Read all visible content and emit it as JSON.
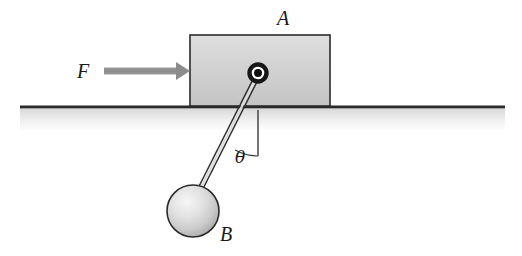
{
  "figure": {
    "background_color": "#ffffff",
    "width": 522,
    "height": 256
  },
  "labels": {
    "block_label": "A",
    "force_label": "F",
    "ball_label": "B",
    "angle_label": "θ"
  },
  "colors": {
    "outline": "#1a1a1a",
    "block_fill_top": "#d6d6d6",
    "block_fill_bottom": "#c2c2c2",
    "ground_dark_line": "#2b2b2b",
    "ground_band_top": "#d8d8d8",
    "ground_band_bottom": "#fbfbfb",
    "arrow_gray": "#8c8c8c",
    "ball_highlight": "#f2f2f2",
    "ball_shade": "#b5b5b5",
    "rod_gray": "#6e6e6e",
    "pivot_ring": "#1a1a1a"
  },
  "geometry": {
    "block": {
      "x": 190,
      "y": 35,
      "width": 140,
      "height": 71
    },
    "ground_line": {
      "x1": 20,
      "y1": 107,
      "x2": 505,
      "y2": 107
    },
    "ground_band": {
      "x": 20,
      "y": 108,
      "width": 485,
      "height": 22
    },
    "force_arrow": {
      "x1": 104,
      "y1": 71,
      "x2": 190,
      "y2": 71
    },
    "pivot": {
      "cx": 258,
      "cy": 73,
      "outer_r": 9,
      "inner_r": 4
    },
    "rod": {
      "x1": 258,
      "y1": 73,
      "x2": 199,
      "y2": 190
    },
    "ball": {
      "cx": 193,
      "cy": 211,
      "r": 26
    },
    "vertical_reference": {
      "x": 258,
      "y1": 110,
      "y2": 156
    },
    "angle_arc_radius": 46,
    "label_positions": {
      "block_label": {
        "x": 283,
        "y": 25
      },
      "force_label": {
        "x": 83,
        "y": 78
      },
      "ball_label": {
        "x": 219,
        "y": 240
      },
      "angle_label": {
        "x": 234,
        "y": 162
      }
    }
  }
}
